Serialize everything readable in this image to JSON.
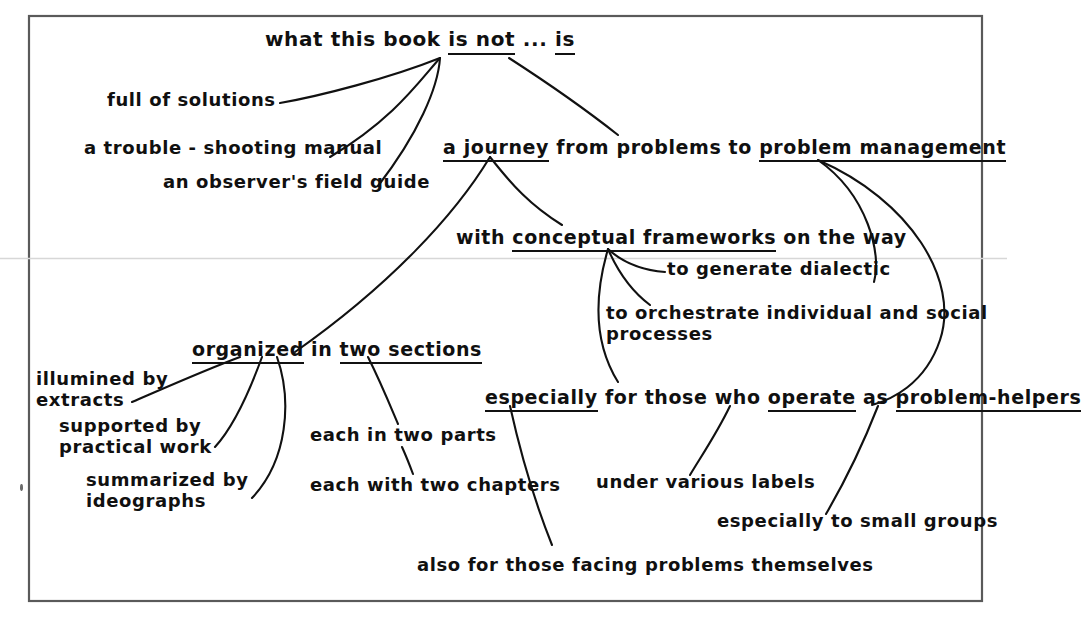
{
  "meta": {
    "kind": "hand-drawn mind-map / concept diagram",
    "background_color": "#ffffff",
    "ink_color": "#111111",
    "frame_color": "#555555"
  },
  "frame": {
    "label": "diagram-frame",
    "x": 28,
    "y": 15,
    "width": 955,
    "height": 587
  },
  "nodes": {
    "title": {
      "pre": "what this book",
      "em1": "is not",
      "mid": "...",
      "em2": "is"
    },
    "n_full_of_solutions": "full of solutions",
    "n_trouble_shooting": "a trouble - shooting manual",
    "n_observers_guide": "an observer's field guide",
    "n_journey_pre": "a journey",
    "n_journey_mid": "from problems to",
    "n_problem_management": "problem management",
    "n_with": "with",
    "n_conceptual_frameworks": "conceptual frameworks",
    "n_on_the_way": "on the way",
    "n_generate_dialectic": "to generate dialectic",
    "n_orchestrate_line1": "to orchestrate individual and social",
    "n_orchestrate_line2": "processes",
    "n_organized": "organized",
    "n_in": "in",
    "n_two_sections": "two sections",
    "n_illumined_line1": "illumined by",
    "n_illumined_line2": "extracts",
    "n_supported_line1": "supported by",
    "n_supported_line2": "practical work",
    "n_summarized_line1": "summarized by",
    "n_summarized_line2": "ideographs",
    "n_each_two_parts": "each in two parts",
    "n_each_two_chapters": "each with two chapters",
    "n_especially": "especially",
    "n_for_those_who": "for those who",
    "n_operate": "operate",
    "n_as": "as",
    "n_problem_helpers": "problem-helpers",
    "n_under_various_labels": "under various labels",
    "n_especially_small_groups": "especially to small groups",
    "n_also_for_those": "also for those facing problems themselves"
  },
  "connectors": [
    {
      "name": "title-isnot-to-full-of-solutions",
      "from": "is not",
      "to": "full of solutions"
    },
    {
      "name": "title-isnot-to-trouble-shooting",
      "from": "is not",
      "to": "a trouble - shooting manual"
    },
    {
      "name": "title-isnot-to-observers-guide",
      "from": "is not",
      "to": "an observer's field guide"
    },
    {
      "name": "title-is-to-journey",
      "from": "is",
      "to": "a journey"
    },
    {
      "name": "journey-to-organized",
      "from": "a journey",
      "to": "organized in two sections"
    },
    {
      "name": "journey-to-conceptual-frameworks",
      "from": "a journey",
      "to": "with conceptual frameworks on the way"
    },
    {
      "name": "frameworks-to-generate-dialectic",
      "from": "conceptual frameworks",
      "to": "to generate dialectic"
    },
    {
      "name": "frameworks-to-orchestrate",
      "from": "conceptual frameworks",
      "to": "to orchestrate individual and social processes"
    },
    {
      "name": "frameworks-to-especially",
      "from": "conceptual frameworks",
      "to": "especially for those who operate as problem-helpers"
    },
    {
      "name": "problem-management-to-orchestrate",
      "from": "problem management",
      "to": "to orchestrate individual and social processes"
    },
    {
      "name": "problem-management-to-problem-helpers",
      "from": "problem management",
      "to": "problem-helpers"
    },
    {
      "name": "organized-to-illumined",
      "from": "organized",
      "to": "illumined by extracts"
    },
    {
      "name": "organized-to-supported",
      "from": "organized",
      "to": "supported by practical work"
    },
    {
      "name": "organized-to-summarized",
      "from": "organized",
      "to": "summarized by ideographs"
    },
    {
      "name": "two-sections-to-each-two-parts",
      "from": "two sections",
      "to": "each in two parts"
    },
    {
      "name": "each-two-parts-to-each-two-chapters",
      "from": "each in two parts",
      "to": "each with two chapters"
    },
    {
      "name": "especially-to-also-for-those",
      "from": "especially",
      "to": "also for those facing problems themselves"
    },
    {
      "name": "operate-to-under-various-labels",
      "from": "operate",
      "to": "under various labels"
    },
    {
      "name": "problem-helpers-to-small-groups",
      "from": "problem-helpers",
      "to": "especially to small groups"
    }
  ]
}
